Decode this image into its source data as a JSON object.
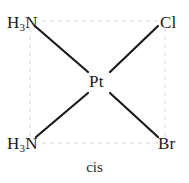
{
  "diagram": {
    "kind": "square-planar-coordination-complex",
    "caption": "cis",
    "center_atom": {
      "symbol": "Pt",
      "name": "platinum"
    },
    "ligands": [
      {
        "id": "nh3-top-left",
        "symbol_head": "H",
        "subscript": "3",
        "symbol_tail": "N",
        "position": "top-left"
      },
      {
        "id": "cl-top-right",
        "symbol_head": "Cl",
        "subscript": "",
        "symbol_tail": "",
        "position": "top-right"
      },
      {
        "id": "nh3-bottom-left",
        "symbol_head": "H",
        "subscript": "3",
        "symbol_tail": "N",
        "position": "bottom-left"
      },
      {
        "id": "br-bottom-right",
        "symbol_head": "Br",
        "subscript": "",
        "symbol_tail": "",
        "position": "bottom-right"
      }
    ],
    "colors": {
      "background": "#ffffff",
      "bond_stroke": "#1a1a1a",
      "guide_stroke": "#d8d8d8",
      "text": "#1a1a1a"
    },
    "geometry": {
      "center_x": 97,
      "center_y": 82,
      "guide_square": {
        "left": 30,
        "top": 21,
        "right": 165,
        "bottom": 143
      }
    }
  }
}
